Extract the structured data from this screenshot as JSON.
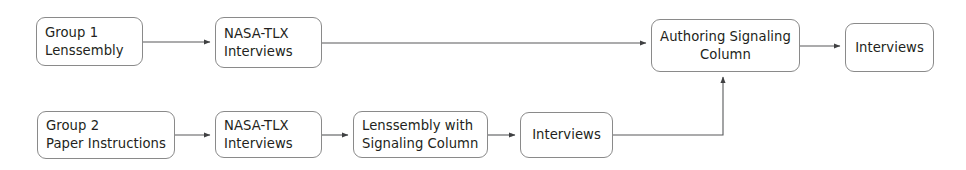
{
  "diagram": {
    "background_color": "#ffffff",
    "line_color": "#58595b",
    "box_border_color": "#8a8a8a",
    "text_color": "#231f20",
    "nodes": [
      {
        "id": "group1",
        "lines": [
          "Group 1",
          "Lenssembly"
        ],
        "x": 36,
        "y": 17,
        "w": 107,
        "h": 49,
        "align": "left"
      },
      {
        "id": "nasa_tlx_top",
        "lines": [
          "NASA-TLX",
          "Interviews"
        ],
        "x": 215,
        "y": 17,
        "w": 107,
        "h": 51,
        "align": "left"
      },
      {
        "id": "authoring_signaling_column",
        "lines": [
          "Authoring Signaling",
          "Column"
        ],
        "x": 651,
        "y": 19,
        "w": 149,
        "h": 53,
        "align": "center"
      },
      {
        "id": "interviews_top",
        "lines": [
          "Interviews"
        ],
        "x": 845,
        "y": 23,
        "w": 89,
        "h": 49,
        "align": "center"
      },
      {
        "id": "group2",
        "lines": [
          "Group 2",
          "Paper Instructions"
        ],
        "x": 37,
        "y": 111,
        "w": 138,
        "h": 48,
        "align": "left"
      },
      {
        "id": "nasa_tlx_bottom",
        "lines": [
          "NASA-TLX",
          "Interviews"
        ],
        "x": 215,
        "y": 111,
        "w": 107,
        "h": 47,
        "align": "left"
      },
      {
        "id": "lenssembly_signaling",
        "lines": [
          "Lenssembly with",
          "Signaling Column"
        ],
        "x": 353,
        "y": 111,
        "w": 135,
        "h": 47,
        "align": "left"
      },
      {
        "id": "interviews_bottom",
        "lines": [
          "Interviews"
        ],
        "x": 520,
        "y": 112,
        "w": 93,
        "h": 46,
        "align": "center"
      }
    ],
    "edges": [
      {
        "id": "group1-to-nasa-top",
        "from": "group1",
        "to": "nasa_tlx_top",
        "path": "M143,42 L210,42"
      },
      {
        "id": "nasa-top-to-authoring",
        "from": "nasa_tlx_top",
        "to": "authoring_signaling_column",
        "path": "M322,43 L646,43"
      },
      {
        "id": "authoring-to-interviews-top",
        "from": "authoring_signaling_column",
        "to": "interviews_top",
        "path": "M800,46 L840,46"
      },
      {
        "id": "group2-to-nasa-bottom",
        "from": "group2",
        "to": "nasa_tlx_bottom",
        "path": "M175,135 L210,135"
      },
      {
        "id": "nasa-bottom-to-lenssembly",
        "from": "nasa_tlx_bottom",
        "to": "lenssembly_signaling",
        "path": "M322,135 L348,135"
      },
      {
        "id": "lenssembly-to-interviews-bottom",
        "from": "lenssembly_signaling",
        "to": "interviews_bottom",
        "path": "M488,135 L515,135"
      },
      {
        "id": "interviews-bottom-to-authoring",
        "from": "interviews_bottom",
        "to": "authoring_signaling_column",
        "path": "M613,135 L723,135 L723,77"
      }
    ]
  }
}
